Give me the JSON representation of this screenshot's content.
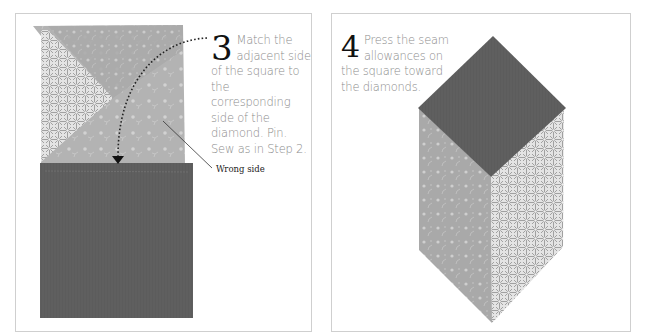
{
  "panels": [
    {
      "id": "step-3",
      "step_number": "3",
      "instruction": "Match the adjacent side of the square to the corresponding side of the diamond. Pin. Sew as in Step 2.",
      "callout_label": "Wrong side"
    },
    {
      "id": "step-4",
      "step_number": "4",
      "instruction": "Press the seam allowances on the square toward the diamonds."
    }
  ],
  "colors": {
    "dark_fabric": "#5c5c5c",
    "light_floral_fabric": "#a9a9a9",
    "geometric_fabric": "#c9c9c9",
    "panel_border": "#cfcfcf",
    "instruction_text": "#8c8c8c"
  }
}
